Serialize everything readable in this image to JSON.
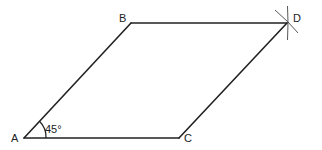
{
  "diagram": {
    "type": "parallelogram-construction",
    "stroke_color": "#222222",
    "vertices": {
      "A": {
        "label": "A",
        "x": 24,
        "y": 138
      },
      "B": {
        "label": "B",
        "x": 131,
        "y": 23
      },
      "C": {
        "label": "C",
        "x": 179,
        "y": 138
      },
      "D": {
        "label": "D",
        "x": 287,
        "y": 23
      }
    },
    "angle": {
      "vertex": "A",
      "label": "45°"
    },
    "edges": [
      "AB",
      "BD",
      "AC",
      "CD"
    ],
    "construction_marks": {
      "at": "D",
      "description": "intersecting compass arcs"
    }
  }
}
